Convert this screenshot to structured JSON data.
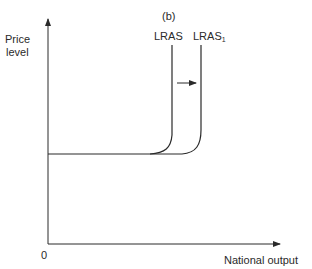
{
  "panel_label": "(b)",
  "y_axis": {
    "label_line1": "Price",
    "label_line2": "level"
  },
  "x_axis": {
    "label": "National output",
    "origin": "0"
  },
  "curves": [
    {
      "name": "LRAS",
      "label": "LRAS"
    },
    {
      "name": "LRAS1",
      "label": "LRAS",
      "subscript": "1"
    }
  ],
  "shift_arrow": {
    "direction": "right"
  },
  "colors": {
    "line": "#2a2a2a",
    "background": "#ffffff"
  }
}
